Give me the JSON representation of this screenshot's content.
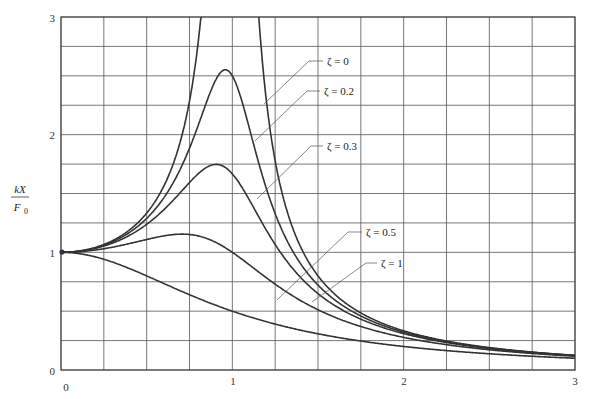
{
  "chart_data": {
    "type": "line",
    "title": "",
    "xlabel": "",
    "ylabel": "kX / F0",
    "ylabel_numerator": "kX",
    "ylabel_denominator": "F0",
    "xlim": [
      0,
      3
    ],
    "ylim": [
      0,
      3
    ],
    "grid": true,
    "grid_step_x": 0.25,
    "grid_step_y": 0.25,
    "x_ticks": [
      "0",
      "1",
      "2",
      "3"
    ],
    "y_ticks": [
      "0",
      "1",
      "2",
      "3"
    ],
    "formula": "kX/F0 = 1 / sqrt((1 - r^2)^2 + (2*zeta*r)^2), r = omega/omega_n",
    "series": [
      {
        "name": "ζ = 0",
        "zeta": 0,
        "label": "ζ = 0",
        "x": [
          0,
          0.25,
          0.5,
          0.75,
          0.9,
          1.1,
          1.25,
          1.5,
          2,
          2.5,
          3
        ],
        "values": [
          1,
          1.07,
          1.33,
          2.29,
          5.26,
          4.76,
          1.78,
          0.8,
          0.33,
          0.19,
          0.13
        ]
      },
      {
        "name": "ζ = 0.2",
        "zeta": 0.2,
        "label": "ζ = 0.2",
        "x": [
          0,
          0.25,
          0.5,
          0.75,
          0.96,
          1.25,
          1.5,
          2,
          2.5,
          3
        ],
        "values": [
          1,
          1.06,
          1.29,
          1.89,
          2.55,
          1.37,
          0.71,
          0.32,
          0.19,
          0.12
        ]
      },
      {
        "name": "ζ = 0.3",
        "zeta": 0.3,
        "label": "ζ = 0.3",
        "x": [
          0,
          0.25,
          0.5,
          0.75,
          0.9,
          1.25,
          1.5,
          2,
          2.5,
          3
        ],
        "values": [
          1,
          1.06,
          1.25,
          1.64,
          1.75,
          1.15,
          0.66,
          0.31,
          0.18,
          0.12
        ]
      },
      {
        "name": "ζ = 0.5",
        "zeta": 0.5,
        "label": "ζ = 0.5",
        "x": [
          0,
          0.25,
          0.5,
          0.71,
          1,
          1.5,
          2,
          2.5,
          3
        ],
        "values": [
          1,
          1.04,
          1.11,
          1.15,
          1.0,
          0.55,
          0.28,
          0.17,
          0.11
        ]
      },
      {
        "name": "ζ = 1",
        "zeta": 1,
        "label": "ζ = 1",
        "x": [
          0,
          0.25,
          0.5,
          1,
          1.5,
          2,
          2.5,
          3
        ],
        "values": [
          1,
          0.94,
          0.8,
          0.5,
          0.31,
          0.2,
          0.14,
          0.1
        ]
      }
    ],
    "annotations": [
      {
        "text": "ζ = 0",
        "leader_to_curve": "ζ = 0"
      },
      {
        "text": "ζ = 0.2",
        "leader_to_curve": "ζ = 0.2"
      },
      {
        "text": "ζ = 0.3",
        "leader_to_curve": "ζ = 0.3"
      },
      {
        "text": "ζ = 0.5",
        "leader_to_curve": "ζ = 0.5"
      },
      {
        "text": "ζ = 1",
        "leader_to_curve": "ζ = 1"
      }
    ],
    "legend_position": "inline-labels"
  },
  "labels": {
    "x0": "0",
    "x1": "1",
    "x2": "2",
    "x3": "3",
    "y0": "0",
    "y1": "1",
    "y2": "2",
    "y3": "3",
    "ylabel_num": "kX",
    "ylabel_den_base": "F",
    "ylabel_den_sub": "0",
    "zeta0": "ζ = 0",
    "zeta02": "ζ = 0.2",
    "zeta03": "ζ = 0.3",
    "zeta05": "ζ = 0.5",
    "zeta1": "ζ = 1"
  },
  "colors": {
    "curve": "#333333",
    "grid": "#555555",
    "axis": "#333333",
    "background": "#ffffff"
  }
}
